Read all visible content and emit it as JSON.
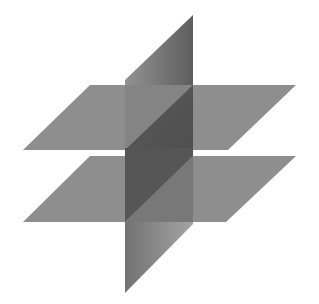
{
  "diagram": {
    "type": "geometry-planes",
    "colors": {
      "background": "#ffffff",
      "horizontal_plane": "#8e8e8e",
      "vertical_plane_top_light": "#8f8f8f",
      "vertical_plane_top_dark": "#626262",
      "vertical_plane_between": "#565656",
      "vertical_plane_between_lower": "#7a7a7a",
      "vertical_plane_bottom_light": "#9a9a9a",
      "vertical_plane_bottom_dark": "#6e6e6e"
    },
    "upper_plane": {
      "points": "90,85 296,85 228,150 23,150"
    },
    "lower_plane": {
      "points": "90,156 296,156 226,222 23,222"
    },
    "vertical_plane": {
      "top_part": "125,80 193,15 193,85 125,85",
      "upper_covered": "125,85 193,85 193,85 125,150",
      "between": "125,150 193,85 193,156 125,156",
      "lower_dark": "125,156 193,156 125,222",
      "lower_light": "193,156 193,224 125,222",
      "bottom_part": "125,222 193,224 125,293"
    }
  }
}
